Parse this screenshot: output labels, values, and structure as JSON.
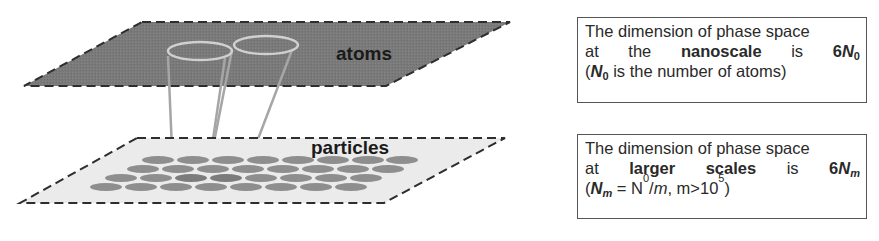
{
  "diagram": {
    "top_plane": {
      "label": "atoms",
      "fill": "#7a7a7a",
      "border": "#333333"
    },
    "bottom_plane": {
      "label": "particles",
      "fill": "#ebebeb",
      "border": "#333333",
      "particle_color": "#8a8a8a"
    },
    "connector_color": "#a0a0a0",
    "ring_color": "#cfcfcf"
  },
  "boxes": {
    "top": {
      "line1": "The dimension of phase space",
      "line2_words": [
        "at",
        "the",
        "nanoscale",
        "is"
      ],
      "line2_value_prefix": "6",
      "line2_value_var": "N",
      "line2_value_sub": "0",
      "line3_var": "N",
      "line3_sub": "0",
      "line3_rest": " is the number of atoms)",
      "line3_open": "("
    },
    "bottom": {
      "line1": "The dimension of phase space",
      "line2_words": [
        "at",
        "larger",
        "scales",
        "is"
      ],
      "line2_value_prefix": "6",
      "line2_value_var": "N",
      "line2_value_sub": "m",
      "line3_open": "(",
      "line3_var": "N",
      "line3_sub": "m",
      "line3_eq": " = N",
      "line3_eq_sub": "0",
      "line3_div": "/",
      "line3_m": "m",
      "line3_cond": ", m>10",
      "line3_exp": "5",
      "line3_close": ")"
    }
  }
}
